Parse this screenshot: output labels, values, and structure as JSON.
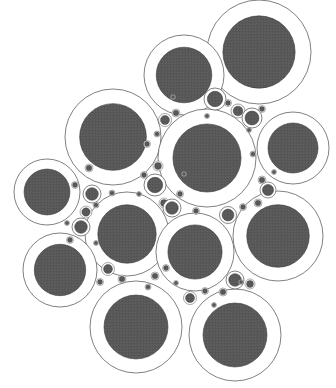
{
  "figure": {
    "type": "circle-packing-diagram",
    "width": 336,
    "height": 388,
    "background_color": "#ffffff"
  },
  "style": {
    "ring_fill": "#ffffff",
    "ring_stroke": "#4a4a4a",
    "ring_stroke_width": 0.7,
    "disc_fill": "#585858",
    "disc_stroke": "#3a3a3a",
    "disc_stroke_width": 0.6,
    "inner_ratio": 0.695,
    "texture_opacity": 0.16
  },
  "chart_data": {
    "type": "scatter",
    "xlabel": "",
    "ylabel": "",
    "xlim": [
      0,
      336
    ],
    "ylim": [
      0,
      388
    ],
    "grid": false,
    "legend": "none",
    "circles": [
      {
        "name": "circle-top-right",
        "cx": 259,
        "cy": 52,
        "r": 52
      },
      {
        "name": "circle-top-center",
        "cx": 184,
        "cy": 75,
        "r": 40
      },
      {
        "name": "circle-upper-left",
        "cx": 113,
        "cy": 137,
        "r": 48
      },
      {
        "name": "circle-center",
        "cx": 207,
        "cy": 158,
        "r": 49
      },
      {
        "name": "circle-right-upper",
        "cx": 293,
        "cy": 148,
        "r": 36
      },
      {
        "name": "circle-left",
        "cx": 47,
        "cy": 192,
        "r": 33
      },
      {
        "name": "circle-mid-left",
        "cx": 127,
        "cy": 234,
        "r": 42
      },
      {
        "name": "circle-mid-center",
        "cx": 195,
        "cy": 252,
        "r": 39
      },
      {
        "name": "circle-right-lower",
        "cx": 278,
        "cy": 236,
        "r": 45
      },
      {
        "name": "circle-lower-left",
        "cx": 60,
        "cy": 270,
        "r": 37
      },
      {
        "name": "circle-bottom-left",
        "cx": 136,
        "cy": 327,
        "r": 46
      },
      {
        "name": "circle-bottom-right",
        "cx": 235,
        "cy": 335,
        "r": 46
      },
      {
        "name": "circle-gap-a1",
        "cx": 215,
        "cy": 99,
        "r": 11
      },
      {
        "name": "circle-gap-a2",
        "cx": 238,
        "cy": 111,
        "r": 7
      },
      {
        "name": "circle-gap-a3",
        "cx": 252,
        "cy": 118,
        "r": 10
      },
      {
        "name": "circle-gap-a4",
        "cx": 165,
        "cy": 120,
        "r": 6.5
      },
      {
        "name": "circle-gap-a5",
        "cx": 176,
        "cy": 113,
        "r": 4
      },
      {
        "name": "circle-gap-a6",
        "cx": 228,
        "cy": 103,
        "r": 3.5
      },
      {
        "name": "circle-gap-a7",
        "cx": 262,
        "cy": 109,
        "r": 3.5
      },
      {
        "name": "circle-gap-b1",
        "cx": 155,
        "cy": 185,
        "r": 11
      },
      {
        "name": "circle-gap-b2",
        "cx": 158,
        "cy": 166,
        "r": 5
      },
      {
        "name": "circle-gap-b3",
        "cx": 164,
        "cy": 203,
        "r": 5
      },
      {
        "name": "circle-gap-b4",
        "cx": 172,
        "cy": 208,
        "r": 9
      },
      {
        "name": "circle-gap-b5",
        "cx": 144,
        "cy": 175,
        "r": 3.5
      },
      {
        "name": "circle-gap-b6",
        "cx": 180,
        "cy": 194,
        "r": 3.5
      },
      {
        "name": "circle-gap-c1",
        "cx": 92,
        "cy": 194,
        "r": 9
      },
      {
        "name": "circle-gap-c2",
        "cx": 86,
        "cy": 212,
        "r": 6
      },
      {
        "name": "circle-gap-c3",
        "cx": 81,
        "cy": 227,
        "r": 9
      },
      {
        "name": "circle-gap-c4",
        "cx": 75,
        "cy": 185,
        "r": 3.5
      },
      {
        "name": "circle-gap-c5",
        "cx": 70,
        "cy": 240,
        "r": 3.5
      },
      {
        "name": "circle-gap-c6",
        "cx": 96,
        "cy": 205,
        "r": 3
      },
      {
        "name": "circle-gap-d1",
        "cx": 268,
        "cy": 190,
        "r": 8
      },
      {
        "name": "circle-gap-d2",
        "cx": 262,
        "cy": 180,
        "r": 4
      },
      {
        "name": "circle-gap-d3",
        "cx": 258,
        "cy": 203,
        "r": 4
      },
      {
        "name": "circle-gap-d4",
        "cx": 228,
        "cy": 215,
        "r": 8.5
      },
      {
        "name": "circle-gap-d5",
        "cx": 243,
        "cy": 207,
        "r": 3.5
      },
      {
        "name": "circle-gap-e1",
        "cx": 235,
        "cy": 280,
        "r": 9
      },
      {
        "name": "circle-gap-e2",
        "cx": 250,
        "cy": 284,
        "r": 5
      },
      {
        "name": "circle-gap-e3",
        "cx": 223,
        "cy": 292,
        "r": 4
      },
      {
        "name": "circle-gap-e4",
        "cx": 190,
        "cy": 298,
        "r": 6.5
      },
      {
        "name": "circle-gap-e5",
        "cx": 205,
        "cy": 291,
        "r": 3.5
      },
      {
        "name": "circle-gap-f1",
        "cx": 108,
        "cy": 269,
        "r": 6.5
      },
      {
        "name": "circle-gap-f2",
        "cx": 122,
        "cy": 279,
        "r": 4
      },
      {
        "name": "circle-gap-f3",
        "cx": 100,
        "cy": 282,
        "r": 3.5
      },
      {
        "name": "circle-gap-f4",
        "cx": 155,
        "cy": 276,
        "r": 4
      },
      {
        "name": "circle-gap-f5",
        "cx": 166,
        "cy": 268,
        "r": 3.5
      },
      {
        "name": "circle-gap-g1",
        "cx": 89,
        "cy": 168,
        "r": 4
      },
      {
        "name": "circle-gap-g2",
        "cx": 147,
        "cy": 144,
        "r": 3.5
      },
      {
        "name": "circle-gap-g3",
        "cx": 157,
        "cy": 134,
        "r": 3
      },
      {
        "name": "circle-gap-g4",
        "cx": 196,
        "cy": 211,
        "r": 3.5
      },
      {
        "name": "circle-gap-g5",
        "cx": 253,
        "cy": 154,
        "r": 3
      },
      {
        "name": "circle-gap-g6",
        "cx": 241,
        "cy": 282,
        "r": 2.5
      },
      {
        "name": "circle-gap-g7",
        "cx": 148,
        "cy": 287,
        "r": 3
      },
      {
        "name": "circle-gap-g8",
        "cx": 176,
        "cy": 283,
        "r": 2.5
      },
      {
        "name": "circle-gap-g9",
        "cx": 112,
        "cy": 193,
        "r": 3
      },
      {
        "name": "circle-gap-g10",
        "cx": 184,
        "cy": 174,
        "r": 2.5
      },
      {
        "name": "circle-gap-g11",
        "cx": 173,
        "cy": 97,
        "r": 2.5
      },
      {
        "name": "circle-gap-g12",
        "cx": 249,
        "cy": 130,
        "r": 2.5
      },
      {
        "name": "circle-gap-g13",
        "cx": 274,
        "cy": 172,
        "r": 2.5
      },
      {
        "name": "circle-gap-g14",
        "cx": 67,
        "cy": 223,
        "r": 2.5
      },
      {
        "name": "circle-gap-g15",
        "cx": 96,
        "cy": 243,
        "r": 2.5
      },
      {
        "name": "circle-gap-g16",
        "cx": 214,
        "cy": 305,
        "r": 2.5
      },
      {
        "name": "circle-gap-g17",
        "cx": 139,
        "cy": 194,
        "r": 2.5
      },
      {
        "name": "circle-gap-g18",
        "cx": 207,
        "cy": 116,
        "r": 2.5
      }
    ]
  }
}
